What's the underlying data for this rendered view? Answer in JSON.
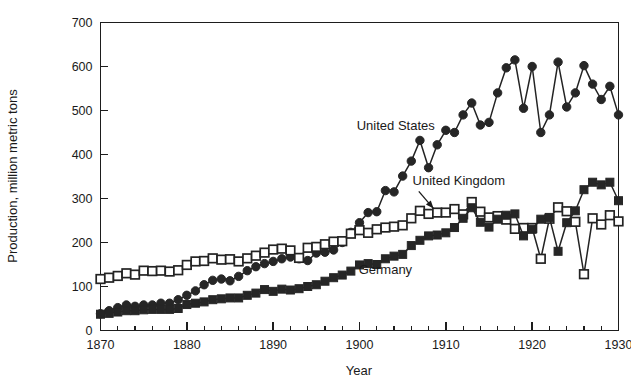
{
  "chart_data": {
    "type": "line",
    "title": "",
    "xlabel": "Year",
    "ylabel": "Production, million metric tons",
    "xlim": [
      1870,
      1930
    ],
    "ylim": [
      0,
      700
    ],
    "x_major_ticks": [
      1870,
      1880,
      1890,
      1900,
      1910,
      1920,
      1930
    ],
    "x_minor_step": 2,
    "y_ticks": [
      0,
      100,
      200,
      300,
      400,
      500,
      600,
      700
    ],
    "grid": false,
    "legend_position": "inline-annotations",
    "annotations": [
      {
        "label": "United States",
        "x": 1904.2,
        "y": 455,
        "marker": "filled-circle"
      },
      {
        "label": "United Kingdom",
        "x": 1911.5,
        "y": 330,
        "marker": "open-square",
        "arrow_to_x": 1908.0,
        "arrow_to_y": 268
      },
      {
        "label": "Germany",
        "x": 1903.0,
        "y": 128,
        "marker": "filled-square"
      }
    ],
    "x": [
      1870,
      1871,
      1872,
      1873,
      1874,
      1875,
      1876,
      1877,
      1878,
      1879,
      1880,
      1881,
      1882,
      1883,
      1884,
      1885,
      1886,
      1887,
      1888,
      1889,
      1890,
      1891,
      1892,
      1893,
      1894,
      1895,
      1896,
      1897,
      1898,
      1899,
      1900,
      1901,
      1902,
      1903,
      1904,
      1905,
      1906,
      1907,
      1908,
      1909,
      1910,
      1911,
      1912,
      1913,
      1914,
      1915,
      1916,
      1917,
      1918,
      1919,
      1920,
      1921,
      1922,
      1923,
      1924,
      1925,
      1926,
      1927,
      1928,
      1929,
      1930
    ],
    "series": [
      {
        "name": "United States",
        "marker": "filled-circle",
        "values": [
          38,
          45,
          52,
          58,
          55,
          58,
          58,
          62,
          62,
          70,
          80,
          90,
          104,
          114,
          117,
          113,
          123,
          136,
          145,
          152,
          157,
          163,
          167,
          163,
          159,
          176,
          178,
          183,
          200,
          223,
          245,
          268,
          270,
          318,
          315,
          351,
          385,
          432,
          370,
          422,
          455,
          450,
          490,
          517,
          467,
          473,
          540,
          597,
          615,
          505,
          600,
          450,
          490,
          610,
          508,
          540,
          602,
          560,
          525,
          555,
          490
        ]
      },
      {
        "name": "United Kingdom",
        "marker": "open-square",
        "values": [
          117,
          120,
          124,
          130,
          127,
          136,
          135,
          136,
          134,
          137,
          149,
          157,
          158,
          164,
          161,
          162,
          157,
          164,
          170,
          177,
          184,
          186,
          182,
          165,
          188,
          190,
          196,
          202,
          203,
          220,
          228,
          222,
          230,
          234,
          236,
          239,
          255,
          272,
          265,
          268,
          268,
          276,
          264,
          292,
          270,
          257,
          260,
          252,
          231,
          233,
          233,
          163,
          254,
          280,
          271,
          247,
          128,
          255,
          241,
          262,
          248
        ]
      },
      {
        "name": "Germany",
        "marker": "filled-square",
        "values": [
          37,
          39,
          42,
          45,
          45,
          47,
          48,
          48,
          48,
          50,
          59,
          62,
          65,
          70,
          72,
          74,
          74,
          80,
          85,
          93,
          89,
          94,
          92,
          95,
          100,
          104,
          112,
          120,
          126,
          135,
          149,
          152,
          150,
          163,
          169,
          173,
          193,
          205,
          215,
          217,
          222,
          234,
          255,
          279,
          246,
          235,
          253,
          262,
          265,
          215,
          230,
          253,
          257,
          180,
          245,
          272,
          320,
          337,
          331,
          337,
          295
        ]
      }
    ]
  }
}
